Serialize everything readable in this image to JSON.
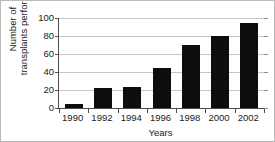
{
  "chart_data": {
    "type": "bar",
    "title": "",
    "xlabel": "Years",
    "ylabel_line1": "Number of",
    "ylabel_line2": "transplants performed",
    "ylabel": "Number of transplants performed",
    "categories": [
      "1990",
      "1992",
      "1994",
      "1996",
      "1998",
      "2000",
      "2002"
    ],
    "values": [
      4,
      22,
      23,
      45,
      70,
      80,
      94
    ],
    "yticks": [
      "0",
      "20",
      "40",
      "60",
      "80",
      "100"
    ],
    "ytick_values": [
      0,
      20,
      40,
      60,
      80,
      100
    ],
    "ylim": [
      0,
      100
    ],
    "grid": "horizontal",
    "legend": "none",
    "bar_color": "#0d0d0d",
    "gridline_color": "#c6c6c6",
    "axis_color": "#4d4d4d",
    "text_color": "#1a1a1a",
    "background_color": "#ffffff"
  }
}
